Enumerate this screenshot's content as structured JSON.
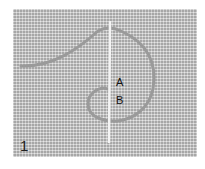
{
  "figure": {
    "step_number": "1",
    "point_labels": [
      "A",
      "B"
    ],
    "colors": {
      "fabric": "#c9c9c9",
      "thread": "#9a9a9a",
      "needle": "#f4f4f4"
    }
  }
}
